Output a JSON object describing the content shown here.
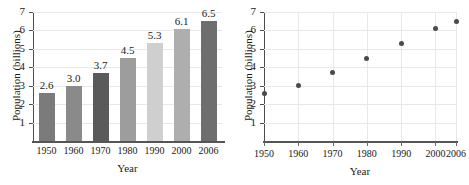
{
  "chart_data": [
    {
      "type": "bar",
      "title": "",
      "xlabel": "Year",
      "ylabel": "Population (billions)",
      "categories": [
        "1950",
        "1960",
        "1970",
        "1980",
        "1990",
        "2000",
        "2006"
      ],
      "values": [
        2.6,
        3.0,
        3.7,
        4.5,
        5.3,
        6.1,
        6.5
      ],
      "value_labels": [
        "2.6",
        "3.0",
        "3.7",
        "4.5",
        "5.3",
        "6.1",
        "6.5"
      ],
      "bar_colors": [
        "#7b7b7b",
        "#8a8a8a",
        "#5a5a5a",
        "#9d9d9d",
        "#cfcfcf",
        "#aeaeae",
        "#6e6e6e"
      ],
      "ylim": [
        0,
        7
      ],
      "yticks": [
        "1",
        "2",
        "3",
        "4",
        "5",
        "6",
        "7"
      ],
      "grid": "horizontal",
      "legend": "none"
    },
    {
      "type": "scatter",
      "title": "",
      "xlabel": "Year",
      "ylabel": "Population (billions)",
      "x": [
        1950,
        1960,
        1970,
        1980,
        1990,
        2000,
        2006
      ],
      "y": [
        2.6,
        3.0,
        3.7,
        4.5,
        5.3,
        6.1,
        6.5
      ],
      "xticks": [
        "1950",
        "1960",
        "1970",
        "1980",
        "1990",
        "2000",
        "2006"
      ],
      "xlim": [
        1950,
        2006
      ],
      "ylim": [
        0,
        7
      ],
      "yticks": [
        "1",
        "2",
        "3",
        "4",
        "5",
        "6",
        "7"
      ],
      "grid": "both",
      "marker_color": "#4a4a4f",
      "legend": "none"
    }
  ],
  "bar_chart": {
    "ylabel": "Population (billions)",
    "xlabel": "Year",
    "yticks": [
      "1",
      "2",
      "3",
      "4",
      "5",
      "6",
      "7"
    ],
    "bars": [
      {
        "category": "1950",
        "value": "2.6"
      },
      {
        "category": "1960",
        "value": "3.0"
      },
      {
        "category": "1970",
        "value": "3.7"
      },
      {
        "category": "1980",
        "value": "4.5"
      },
      {
        "category": "1990",
        "value": "5.3"
      },
      {
        "category": "2000",
        "value": "6.1"
      },
      {
        "category": "2006",
        "value": "6.5"
      }
    ]
  },
  "scatter_chart": {
    "ylabel": "Population (billions)",
    "xlabel": "Year",
    "yticks": [
      "1",
      "2",
      "3",
      "4",
      "5",
      "6",
      "7"
    ],
    "xticks": [
      "1950",
      "1960",
      "1970",
      "1980",
      "1990",
      "2000",
      "2006"
    ]
  }
}
